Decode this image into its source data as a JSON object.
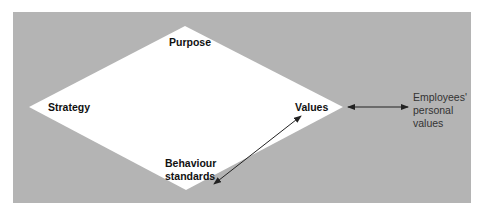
{
  "colors": {
    "background": "#ffffff",
    "panel": "#b4b4b4",
    "diamond": "#ffffff",
    "text": "#111111",
    "arrow": "#222222"
  },
  "diagram": {
    "nodes": {
      "top": "Purpose",
      "left": "Strategy",
      "right": "Values",
      "bottom_line1": "Behaviour",
      "bottom_line2": "standards"
    },
    "external": {
      "line1": "Employees'",
      "line2": "personal",
      "line3": "values"
    },
    "arrows": [
      {
        "from": "Values",
        "to": "Employees' personal values",
        "type": "bidirectional"
      },
      {
        "from": "Behaviour standards",
        "to": "Values",
        "type": "bidirectional"
      }
    ]
  }
}
